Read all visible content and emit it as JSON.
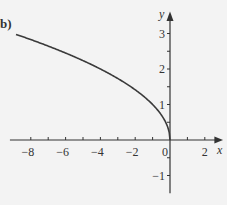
{
  "part_label": "b)",
  "chart_data": {
    "type": "line",
    "title": "",
    "function": "y = sqrt(-x)",
    "xlabel": "x",
    "ylabel": "y",
    "xlim": [
      -9.2,
      3
    ],
    "ylim": [
      -1.5,
      3.6
    ],
    "x_ticks": [
      -8,
      -7,
      -6,
      -5,
      -4,
      -3,
      -2,
      -1,
      0,
      1,
      2
    ],
    "x_tick_labels": [
      "−8",
      "−6",
      "−4",
      "−2",
      "0",
      "2"
    ],
    "x_tick_label_values": [
      -8,
      -6,
      -4,
      -2,
      0,
      2
    ],
    "y_ticks": [
      -1,
      -0.5,
      0.5,
      1,
      1.5,
      2,
      2.5,
      3
    ],
    "y_tick_labels": [
      "3",
      "2",
      "1",
      "−1"
    ],
    "y_tick_label_values": [
      3,
      2,
      1,
      -1
    ],
    "grid": false,
    "series": [
      {
        "name": "y = √(−x)",
        "x": [
          -9,
          -8,
          -7,
          -6,
          -5,
          -4,
          -3,
          -2,
          -1,
          -0.5,
          -0.1,
          0
        ],
        "y": [
          3.0,
          2.83,
          2.65,
          2.45,
          2.24,
          2.0,
          1.73,
          1.41,
          1.0,
          0.71,
          0.32,
          0
        ]
      }
    ]
  }
}
